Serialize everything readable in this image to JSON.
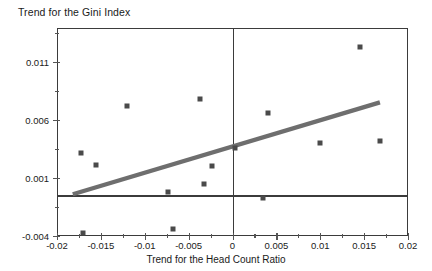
{
  "chart_data": {
    "type": "scatter",
    "title": "Trend for the Gini Index",
    "xlabel": "Trend for the Head Count Ratio",
    "ylabel": "",
    "xlim": [
      -0.02,
      0.02
    ],
    "ylim": [
      -0.004,
      0.0139
    ],
    "grid": false,
    "legend": null,
    "xticks": [
      -0.02,
      -0.015,
      -0.01,
      -0.005,
      0,
      0.005,
      0.01,
      0.015,
      0.02
    ],
    "xtick_labels": [
      "-0.02",
      "-0.015",
      "-0.01",
      "-0.005",
      "0",
      "0.005",
      "0.01",
      "0.015",
      "0.02"
    ],
    "yticks": [
      -0.004,
      0.001,
      0.006,
      0.011
    ],
    "ytick_labels": [
      "-0.004",
      "0.001",
      "0.006",
      "0.011"
    ],
    "xminor_ticks": [
      -0.0175,
      -0.0125,
      -0.0075,
      -0.0025,
      0.0025,
      0.0075,
      0.0125,
      0.0175
    ],
    "yminor_ticks": [
      -0.0015,
      0.0035,
      0.0085,
      0.0135
    ],
    "reference_lines": [
      {
        "name": "vertical-zero-line",
        "axis": "x",
        "value": 0.0
      },
      {
        "name": "horizontal-zero-line",
        "axis": "y",
        "value": -0.0005
      }
    ],
    "marker_color": "#4a4a4a",
    "trend_color": "#6e6e6e",
    "axis_color": "#3b3b3b",
    "points": [
      {
        "x": -0.0173,
        "y": 0.0031
      },
      {
        "x": -0.017,
        "y": -0.0037
      },
      {
        "x": -0.0155,
        "y": 0.0021
      },
      {
        "x": -0.012,
        "y": 0.0072
      },
      {
        "x": -0.0073,
        "y": -0.0002
      },
      {
        "x": -0.0068,
        "y": -0.0034
      },
      {
        "x": -0.0037,
        "y": 0.0078
      },
      {
        "x": -0.0033,
        "y": 0.0005
      },
      {
        "x": -0.0023,
        "y": 0.002
      },
      {
        "x": 0.0003,
        "y": 0.0036
      },
      {
        "x": 0.0035,
        "y": -0.0007
      },
      {
        "x": 0.004,
        "y": 0.0066
      },
      {
        "x": 0.01,
        "y": 0.004
      },
      {
        "x": 0.0145,
        "y": 0.0123
      },
      {
        "x": 0.0168,
        "y": 0.0042
      }
    ],
    "trend_line": {
      "name": "linear-trend",
      "x_start": -0.0182,
      "y_start": -0.0004,
      "x_end": 0.0168,
      "y_end": 0.0075
    }
  }
}
